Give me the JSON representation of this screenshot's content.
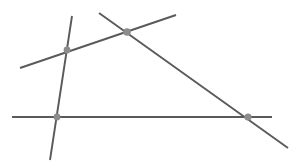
{
  "figure": {
    "type": "line-intersection-diagram",
    "width": 301,
    "height": 166,
    "background_color": "#ffffff",
    "line_color": "#5a5a5a",
    "line_width": 1.9,
    "point_color": "#8c8c8c",
    "point_radius": 3.4
  },
  "lines": [
    {
      "id": "line-ascending",
      "label": "ascending transversal",
      "x1": 20,
      "y1": 68,
      "x2": 176,
      "y2": 15,
      "color": "#5a5a5a",
      "width": 1.9
    },
    {
      "id": "line-descending",
      "label": "descending transversal",
      "x1": 99,
      "y1": 13,
      "x2": 288,
      "y2": 148,
      "color": "#5a5a5a",
      "width": 1.9
    },
    {
      "id": "line-steep",
      "label": "steep near-vertical line",
      "x1": 72,
      "y1": 16,
      "x2": 50,
      "y2": 160,
      "color": "#5a5a5a",
      "width": 1.9
    },
    {
      "id": "line-horizontal",
      "label": "horizontal base line",
      "x1": 12,
      "y1": 117,
      "x2": 272,
      "y2": 117,
      "color": "#5a5a5a",
      "width": 1.9
    }
  ],
  "intersection_points": [
    {
      "id": "point-upper-left",
      "label": "ascending x steep",
      "cx": 67,
      "cy": 50,
      "r": 3.4,
      "color": "#8c8c8c"
    },
    {
      "id": "point-apex",
      "label": "ascending x descending",
      "cx": 127,
      "cy": 32,
      "r": 3.8,
      "color": "#8c8c8c"
    },
    {
      "id": "point-lower-left",
      "label": "steep x horizontal",
      "cx": 57,
      "cy": 117,
      "r": 3.4,
      "color": "#8c8c8c"
    },
    {
      "id": "point-lower-right",
      "label": "descending x horizontal",
      "cx": 248,
      "cy": 117,
      "r": 3.6,
      "color": "#8c8c8c"
    }
  ]
}
